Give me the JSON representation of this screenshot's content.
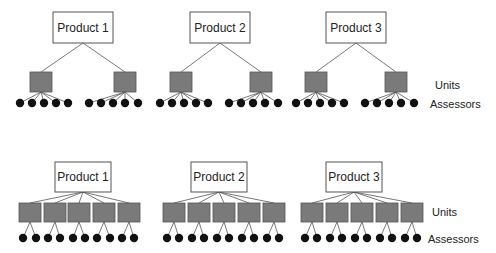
{
  "legend": {
    "units_label": "Units",
    "assessors_label": "Assessors"
  },
  "colors": {
    "product_fill": "#ffffff",
    "unit_fill": "#7a7a7a",
    "assessor_fill": "#111111",
    "line": "#555555"
  },
  "panels": [
    {
      "name": "top-design",
      "description": "2 units per product, 5 assessors per unit",
      "products": [
        {
          "label": "Product 1",
          "box": [
            53,
            12,
            60,
            31
          ],
          "units": [
            {
              "box": [
                30,
                72,
                22,
                20
              ],
              "assessors": [
                20,
                32,
                44,
                56,
                68
              ]
            },
            {
              "box": [
                114,
                72,
                22,
                20
              ],
              "assessors": [
                89,
                101,
                113,
                125,
                138
              ]
            }
          ]
        },
        {
          "label": "Product 2",
          "box": [
            190,
            12,
            60,
            31
          ],
          "units": [
            {
              "box": [
                170,
                72,
                22,
                20
              ],
              "assessors": [
                160,
                172,
                184,
                196,
                208
              ]
            },
            {
              "box": [
                250,
                72,
                22,
                20
              ],
              "assessors": [
                229,
                241,
                253,
                265,
                278
              ]
            }
          ]
        },
        {
          "label": "Product 3",
          "box": [
            326,
            12,
            60,
            31
          ],
          "units": [
            {
              "box": [
                305,
                72,
                22,
                20
              ],
              "assessors": [
                296,
                308,
                320,
                332,
                344
              ]
            },
            {
              "box": [
                385,
                72,
                22,
                20
              ],
              "assessors": [
                365,
                377,
                389,
                401,
                414
              ]
            }
          ]
        }
      ],
      "assessor_y": 103,
      "units_label_pos": [
        435,
        89
      ],
      "assessors_label_pos": [
        430,
        108
      ]
    },
    {
      "name": "bottom-design",
      "description": "5 units per product, 2 assessors per unit",
      "products": [
        {
          "label": "Product 1",
          "box": [
            55,
            162,
            56,
            30
          ],
          "units": [
            {
              "box": [
                19,
                203,
                22,
                19
              ],
              "assessors": [
                23,
                36
              ]
            },
            {
              "box": [
                44,
                203,
                22,
                19
              ],
              "assessors": [
                48,
                60
              ]
            },
            {
              "box": [
                68,
                203,
                22,
                19
              ],
              "assessors": [
                73,
                85
              ]
            },
            {
              "box": [
                93,
                203,
                22,
                19
              ],
              "assessors": [
                97,
                110
              ]
            },
            {
              "box": [
                118,
                203,
                22,
                19
              ],
              "assessors": [
                122,
                134
              ]
            }
          ]
        },
        {
          "label": "Product 2",
          "box": [
            191,
            162,
            56,
            30
          ],
          "units": [
            {
              "box": [
                163,
                203,
                22,
                19
              ],
              "assessors": [
                167,
                179
              ]
            },
            {
              "box": [
                188,
                203,
                22,
                19
              ],
              "assessors": [
                192,
                204
              ]
            },
            {
              "box": [
                213,
                203,
                22,
                19
              ],
              "assessors": [
                217,
                229
              ]
            },
            {
              "box": [
                238,
                203,
                22,
                19
              ],
              "assessors": [
                242,
                254
              ]
            },
            {
              "box": [
                263,
                203,
                22,
                19
              ],
              "assessors": [
                267,
                279
              ]
            }
          ]
        },
        {
          "label": "Product 3",
          "box": [
            326,
            162,
            56,
            30
          ],
          "units": [
            {
              "box": [
                301,
                203,
                22,
                19
              ],
              "assessors": [
                305,
                317
              ]
            },
            {
              "box": [
                326,
                203,
                22,
                19
              ],
              "assessors": [
                330,
                342
              ]
            },
            {
              "box": [
                351,
                203,
                22,
                19
              ],
              "assessors": [
                355,
                367
              ]
            },
            {
              "box": [
                376,
                203,
                22,
                19
              ],
              "assessors": [
                380,
                392
              ]
            },
            {
              "box": [
                401,
                203,
                22,
                19
              ],
              "assessors": [
                405,
                417
              ]
            }
          ]
        }
      ],
      "assessor_y": 238,
      "units_label_pos": [
        432,
        216
      ],
      "assessors_label_pos": [
        428,
        243
      ]
    }
  ]
}
